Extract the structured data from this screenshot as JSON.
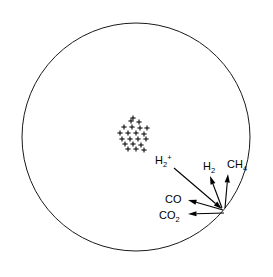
{
  "figure": {
    "background_color": "#ffffff",
    "line_color": "#1a1a1a",
    "text_color": "#000000"
  },
  "sphere": {
    "name": "plasma-sphere",
    "center_x": 136,
    "center_y": 137,
    "radius": 114,
    "stroke_width": 1
  },
  "ion_cluster": {
    "name": "ion-cluster",
    "symbol": "+",
    "count": 21,
    "center_x": 133,
    "center_y": 133,
    "points": [
      {
        "x": 131,
        "y": 121
      },
      {
        "x": 139,
        "y": 122
      },
      {
        "x": 124,
        "y": 127
      },
      {
        "x": 132,
        "y": 127
      },
      {
        "x": 140,
        "y": 128
      },
      {
        "x": 147,
        "y": 128
      },
      {
        "x": 120,
        "y": 133
      },
      {
        "x": 128,
        "y": 133
      },
      {
        "x": 136,
        "y": 133
      },
      {
        "x": 144,
        "y": 134
      },
      {
        "x": 122,
        "y": 139
      },
      {
        "x": 130,
        "y": 139
      },
      {
        "x": 138,
        "y": 139
      },
      {
        "x": 146,
        "y": 139
      },
      {
        "x": 125,
        "y": 144
      },
      {
        "x": 133,
        "y": 144
      },
      {
        "x": 141,
        "y": 145
      },
      {
        "x": 128,
        "y": 149
      },
      {
        "x": 136,
        "y": 149
      },
      {
        "x": 144,
        "y": 150
      },
      {
        "x": 133,
        "y": 118
      }
    ]
  },
  "emission_point": {
    "name": "emission-point",
    "x": 226,
    "y": 212
  },
  "species": [
    {
      "id": "h2-plus",
      "name": "species-h2-plus",
      "formula": "H",
      "subscript": "2",
      "superscript": "+",
      "label_x": 155,
      "label_y": 164,
      "arrow_start_x": 174,
      "arrow_start_y": 168,
      "arrow_end_x": 222,
      "arrow_end_y": 209,
      "direction": "down-right"
    },
    {
      "id": "h2",
      "name": "species-h2",
      "formula": "H",
      "subscript": "2",
      "superscript": "",
      "label_x": 203,
      "label_y": 170,
      "arrow_start_x": 222,
      "arrow_start_y": 208,
      "arrow_end_x": 210,
      "arrow_end_y": 176,
      "direction": "up"
    },
    {
      "id": "ch4",
      "name": "species-ch4",
      "formula": "CH",
      "subscript": "4",
      "superscript": "",
      "label_x": 227,
      "label_y": 168,
      "arrow_start_x": 225,
      "arrow_start_y": 208,
      "arrow_end_x": 228,
      "arrow_end_y": 174,
      "direction": "up"
    },
    {
      "id": "co",
      "name": "species-co",
      "formula": "CO",
      "subscript": "",
      "superscript": "",
      "label_x": 165,
      "label_y": 203,
      "arrow_start_x": 223,
      "arrow_start_y": 210,
      "arrow_end_x": 188,
      "arrow_end_y": 200,
      "direction": "left"
    },
    {
      "id": "co2",
      "name": "species-co2",
      "formula": "CO",
      "subscript": "2",
      "superscript": "",
      "label_x": 159,
      "label_y": 219,
      "arrow_start_x": 224,
      "arrow_start_y": 213,
      "arrow_end_x": 188,
      "arrow_end_y": 214,
      "direction": "left"
    }
  ]
}
